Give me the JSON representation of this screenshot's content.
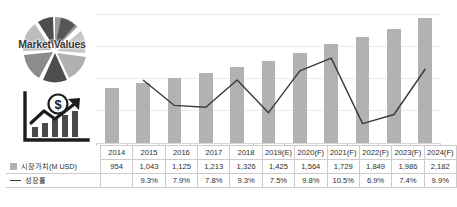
{
  "branding": {
    "logo_text": "Market\\Values",
    "pie_icon": "pie-chart-icon",
    "growth_icon": "bar-chart-growth-dollar-icon"
  },
  "legend": {
    "market_value": {
      "label": "시장가치(M USD)",
      "swatch": "square-swatch",
      "color": "#b2b2b2"
    },
    "growth_rate": {
      "label": "성장률",
      "swatch": "line-swatch",
      "color": "#3a3a3a"
    }
  },
  "caption": "",
  "chart_data": {
    "type": "bar",
    "title": "",
    "xlabel": "",
    "ylabel": "",
    "grid": true,
    "legend_position": "table-row-labels",
    "categories": [
      "2014",
      "2015",
      "2016",
      "2017",
      "2018",
      "2019(E)",
      "2020(F)",
      "2021(F)",
      "2022(F)",
      "2023(F)",
      "2024(F)"
    ],
    "series": [
      {
        "name": "시장가치(M USD)",
        "type": "bar",
        "color": "#b2b2b2",
        "axis": "left",
        "values": [
          954,
          1043,
          1125,
          1213,
          1326,
          1425,
          1564,
          1729,
          1849,
          1986,
          2182
        ],
        "labels": [
          "954",
          "1,043",
          "1,125",
          "1,213",
          "1,326",
          "1,425",
          "1,564",
          "1,729",
          "1,849",
          "1,986",
          "2,182"
        ]
      },
      {
        "name": "성장률",
        "type": "line",
        "color": "#3a3a3a",
        "axis": "right",
        "values": [
          null,
          9.3,
          7.9,
          7.8,
          9.3,
          7.5,
          9.8,
          10.5,
          6.9,
          7.4,
          9.9
        ],
        "labels": [
          "",
          "9.3%",
          "7.9%",
          "7.8%",
          "9.3%",
          "7.5%",
          "9.8%",
          "10.5%",
          "6.9%",
          "7.4%",
          "9.9%"
        ]
      }
    ],
    "ylim": [
      0,
      2400
    ],
    "y2lim": [
      6.0,
      11.0
    ]
  }
}
